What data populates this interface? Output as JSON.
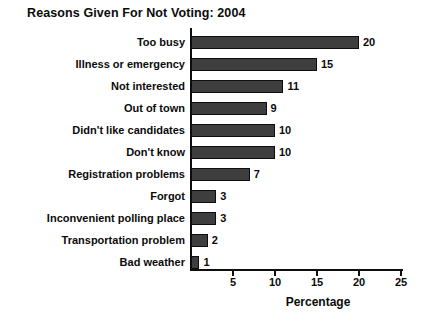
{
  "chart_data": {
    "type": "bar",
    "orientation": "horizontal",
    "title": "Reasons Given For Not Voting: 2004",
    "categories": [
      "Too busy",
      "Illness or emergency",
      "Not interested",
      "Out of town",
      "Didn't like candidates",
      "Don't know",
      "Registration problems",
      "Forgot",
      "Inconvenient polling place",
      "Transportation problem",
      "Bad weather"
    ],
    "values": [
      20,
      15,
      11,
      9,
      10,
      10,
      7,
      3,
      3,
      2,
      1
    ],
    "value_labels_shown": true,
    "xlabel": "Percentage",
    "ylabel": "",
    "xlim": [
      0,
      25
    ],
    "xticks": [
      5,
      10,
      15,
      20,
      25
    ],
    "grid": false,
    "legend": false,
    "bar_color": "#3e3e3e",
    "bar_border_color": "#0d0d0d",
    "axis_color": "#0d0d0d",
    "background_color": "#ffffff"
  }
}
